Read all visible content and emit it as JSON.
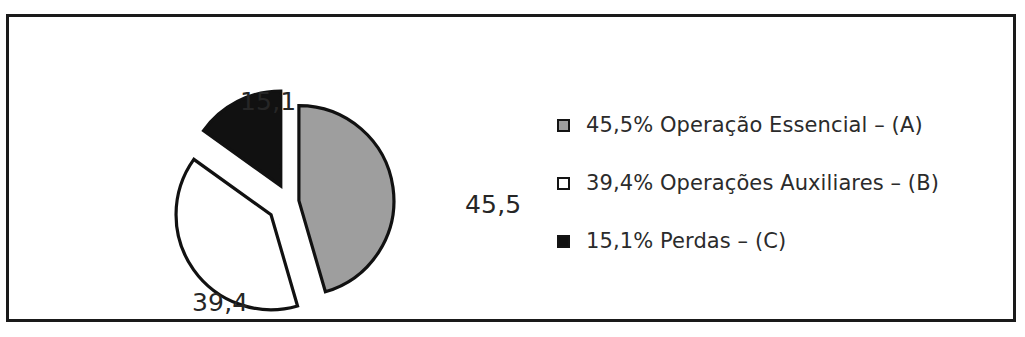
{
  "figure": {
    "background_color": "#ffffff",
    "frame_color": "#1a1a1a",
    "text_color": "#2b2b2b"
  },
  "chart_data": {
    "type": "pie",
    "title": "",
    "xlabel": "",
    "ylabel": "",
    "exploded": true,
    "grid": false,
    "legend_position": "right",
    "categories": [
      "Operação Essencial – (A)",
      "Operações Auxiliares – (B)",
      "Perdas – (C)"
    ],
    "values": [
      45.5,
      39.4,
      15.1
    ],
    "value_labels": [
      "45,5",
      "39,4",
      "15,1"
    ],
    "colors": [
      "#9e9e9e",
      "#ffffff",
      "#111111"
    ],
    "slice_border_color": "#111111",
    "legend_entries": [
      {
        "label": "45,5% Operação Essencial – (A)",
        "percent": "45,5%",
        "name": "Operação Essencial",
        "key": "(A)",
        "swatch_fill": "#9e9e9e"
      },
      {
        "label": "39,4% Operações Auxiliares – (B)",
        "percent": "39,4%",
        "name": "Operações Auxiliares",
        "key": "(B)",
        "swatch_fill": "#ffffff"
      },
      {
        "label": "15,1% Perdas – (C)",
        "percent": "15,1%",
        "name": "Perdas",
        "key": "(C)",
        "swatch_fill": "#111111"
      }
    ]
  },
  "labels": {
    "slice_a": "45,5",
    "slice_b": "39,4",
    "slice_c": "15,1"
  }
}
